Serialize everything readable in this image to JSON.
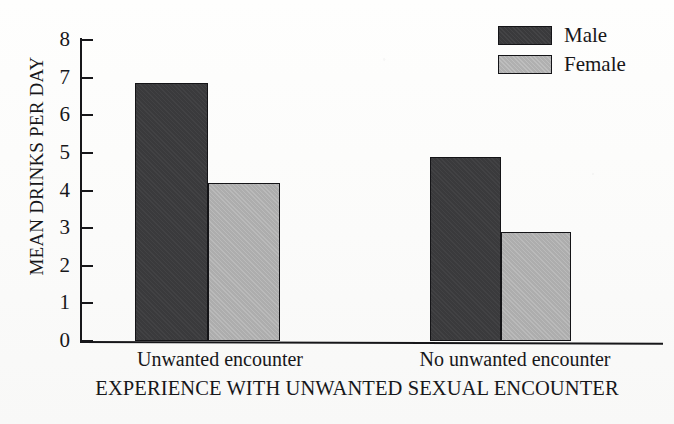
{
  "chart_data": {
    "type": "bar",
    "title": "",
    "xlabel": "EXPERIENCE WITH UNWANTED SEXUAL ENCOUNTER",
    "ylabel": "MEAN DRINKS PER DAY",
    "categories": [
      "Unwanted encounter",
      "No unwanted encounter"
    ],
    "series": [
      {
        "name": "Male",
        "color": "#3a3a3c",
        "values": [
          6.85,
          4.9
        ]
      },
      {
        "name": "Female",
        "color": "#adadad",
        "values": [
          4.2,
          2.9
        ]
      }
    ],
    "ylim": [
      0,
      8
    ],
    "yticks": [
      0,
      1,
      2,
      3,
      4,
      5,
      6,
      7,
      8
    ],
    "ytick_labels": [
      "0",
      "1",
      "2",
      "3",
      "4",
      "5",
      "6",
      "7",
      "8"
    ],
    "grid": false,
    "legend_position": "top-right",
    "legend_entries": [
      "Male",
      "Female"
    ]
  },
  "legend": {
    "male_label": "Male",
    "female_label": "Female"
  },
  "axes": {
    "y_title": "MEAN DRINKS PER DAY",
    "x_title": "EXPERIENCE WITH UNWANTED SEXUAL ENCOUNTER",
    "y_tick_0": "0",
    "y_tick_1": "1",
    "y_tick_2": "2",
    "y_tick_3": "3",
    "y_tick_4": "4",
    "y_tick_5": "5",
    "y_tick_6": "6",
    "y_tick_7": "7",
    "y_tick_8": "8",
    "cat_1": "Unwanted encounter",
    "cat_2": "No unwanted encounter"
  }
}
